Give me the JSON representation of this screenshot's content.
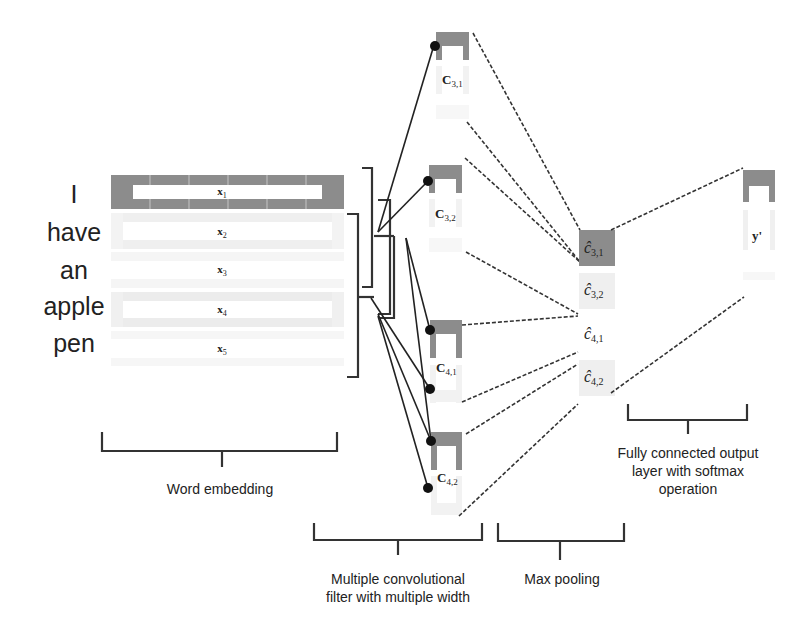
{
  "diagram": {
    "type": "CNN for sentence classification",
    "sentence_words": [
      "I",
      "have",
      "an",
      "apple",
      "pen"
    ],
    "embedding": {
      "rows": [
        {
          "label": "x",
          "sub": "1",
          "highlighted": true
        },
        {
          "label": "x",
          "sub": "2",
          "highlighted": false
        },
        {
          "label": "x",
          "sub": "3",
          "highlighted": false
        },
        {
          "label": "x",
          "sub": "4",
          "highlighted": false
        },
        {
          "label": "x",
          "sub": "5",
          "highlighted": false
        }
      ],
      "caption": "Word embedding"
    },
    "feature_maps": [
      {
        "label": "C",
        "sub": "3,1"
      },
      {
        "label": "C",
        "sub": "3,2"
      },
      {
        "label": "C",
        "sub": "4,1"
      },
      {
        "label": "C",
        "sub": "4,2"
      }
    ],
    "conv_caption_line1": "Multiple convolutional",
    "conv_caption_line2": "filter with multiple width",
    "max_pool": [
      {
        "label": "ĉ",
        "sub": "3,1"
      },
      {
        "label": "ĉ",
        "sub": "3,2"
      },
      {
        "label": "ĉ",
        "sub": "4,1"
      },
      {
        "label": "ĉ",
        "sub": "4,2"
      }
    ],
    "max_pool_caption": "Max pooling",
    "output": {
      "label": "y'"
    },
    "output_caption_line1": "Fully connected output",
    "output_caption_line2": "layer with softmax",
    "output_caption_line3": "operation",
    "colors": {
      "highlight": "#8c8c8c",
      "light": "#efefef",
      "line": "#222222"
    }
  }
}
